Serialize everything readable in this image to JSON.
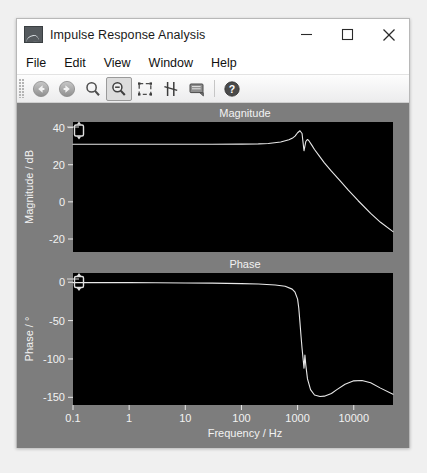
{
  "window": {
    "title": "Impulse Response Analysis",
    "icon": "plot-thumbnail-icon",
    "minimize_label": "–",
    "maximize_label": "□",
    "close_label": "✕"
  },
  "menu": {
    "items": [
      {
        "label": "File"
      },
      {
        "label": "Edit"
      },
      {
        "label": "View"
      },
      {
        "label": "Window"
      },
      {
        "label": "Help"
      }
    ]
  },
  "toolbar": {
    "buttons": [
      {
        "name": "back-icon",
        "tooltip": "Back",
        "active": false
      },
      {
        "name": "forward-icon",
        "tooltip": "Forward",
        "active": false
      },
      {
        "name": "zoom-in-icon",
        "tooltip": "Zoom in",
        "active": false
      },
      {
        "name": "zoom-out-icon",
        "tooltip": "Zoom out",
        "active": true
      },
      {
        "name": "zoom-fit-icon",
        "tooltip": "Zoom to fit",
        "active": false
      },
      {
        "name": "data-cursor-icon",
        "tooltip": "Data cursor",
        "active": false
      },
      {
        "name": "legend-icon",
        "tooltip": "Legend",
        "active": false
      },
      {
        "name": "help-icon",
        "tooltip": "Help",
        "active": false
      }
    ]
  },
  "chart_data": [
    {
      "type": "line",
      "title": "Magnitude",
      "xlabel": "",
      "ylabel": "Magnitude / dB",
      "xscale": "log",
      "xlim": [
        0.1,
        50000
      ],
      "ylim": [
        -27,
        43
      ],
      "xticks": [
        0.1,
        1,
        10,
        100,
        1000,
        10000
      ],
      "xticklabels": [
        "0.1",
        "1",
        "10",
        "100",
        "1000",
        "10000"
      ],
      "yticks": [
        40,
        20,
        0,
        -20
      ],
      "yticklabels": [
        "40",
        "20",
        "0",
        "-20"
      ],
      "grid": false,
      "line_color": "#e8e8e8",
      "bg_color": "#000000",
      "cursor_marker": {
        "x": 0.1,
        "y": 40,
        "name": "range-cursor-handle"
      },
      "series": [
        {
          "name": "magnitude",
          "x": [
            0.1,
            0.3,
            1,
            3,
            10,
            30,
            100,
            200,
            300,
            500,
            700,
            800,
            900,
            1000,
            1100,
            1200,
            1250,
            1300,
            1400,
            1500,
            1600,
            1800,
            2000,
            2500,
            3000,
            4000,
            6000,
            8000,
            12000,
            20000,
            30000,
            50000
          ],
          "y": [
            31.0,
            31.0,
            31.0,
            31.0,
            31.0,
            31.0,
            31.1,
            31.2,
            31.4,
            32.2,
            33.4,
            34.2,
            35.4,
            37.2,
            38.3,
            36.8,
            32.0,
            27.5,
            32.5,
            33.6,
            32.8,
            30.4,
            28.2,
            24.2,
            21.0,
            16.5,
            10.6,
            6.3,
            0.6,
            -6.2,
            -11.0,
            -16.0
          ]
        }
      ]
    },
    {
      "type": "line",
      "title": "Phase",
      "xlabel": "Frequency / Hz",
      "ylabel": "Phase / °",
      "xscale": "log",
      "xlim": [
        0.1,
        50000
      ],
      "ylim": [
        -160,
        12
      ],
      "xticks": [
        0.1,
        1,
        10,
        100,
        1000,
        10000
      ],
      "xticklabels": [
        "0.1",
        "1",
        "10",
        "100",
        "1000",
        "10000"
      ],
      "yticks": [
        0,
        -50,
        -100,
        -150
      ],
      "yticklabels": [
        "0",
        "-50",
        "-100",
        "-150"
      ],
      "grid": false,
      "line_color": "#e8e8e8",
      "bg_color": "#000000",
      "cursor_marker": {
        "x": 0.1,
        "y": 0,
        "name": "range-cursor-handle"
      },
      "series": [
        {
          "name": "phase",
          "x": [
            0.1,
            0.3,
            1,
            3,
            10,
            30,
            100,
            200,
            400,
            600,
            800,
            900,
            1000,
            1050,
            1100,
            1150,
            1200,
            1250,
            1300,
            1350,
            1400,
            1500,
            1700,
            2000,
            2500,
            3000,
            4000,
            5000,
            7000,
            10000,
            14000,
            20000,
            30000,
            50000
          ],
          "y": [
            -0.5,
            -0.5,
            -0.6,
            -0.8,
            -1.0,
            -1.2,
            -1.8,
            -2.4,
            -3.6,
            -5.2,
            -9.0,
            -13.0,
            -22.0,
            -34.0,
            -52.0,
            -70.0,
            -86.0,
            -99.0,
            -112.0,
            -95.0,
            -108.0,
            -126.0,
            -140.0,
            -147.0,
            -149.0,
            -148.5,
            -145.0,
            -140.0,
            -133.0,
            -128.5,
            -128.0,
            -131.0,
            -138.0,
            -146.0
          ]
        }
      ]
    }
  ]
}
